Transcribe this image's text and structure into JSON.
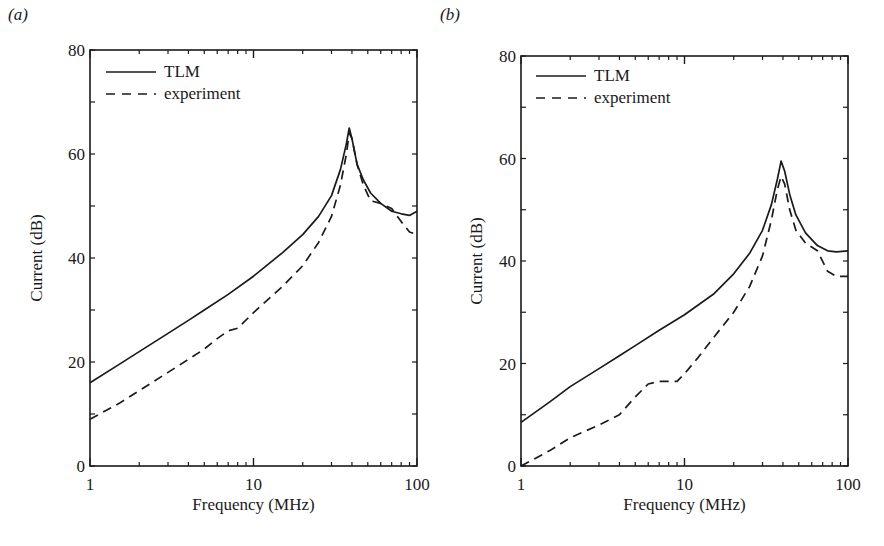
{
  "figure": {
    "panels": [
      "(a)",
      "(b)"
    ]
  },
  "chart_data": [
    {
      "type": "line",
      "panel_label": "(a)",
      "title": "",
      "xlabel": "Frequency (MHz)",
      "ylabel": "Current (dB)",
      "xscale": "log",
      "xlim": [
        1,
        100
      ],
      "ylim": [
        0,
        80
      ],
      "x_tick_labels": [
        "1",
        "10",
        "100"
      ],
      "y_tick_labels": [
        "0",
        "20",
        "40",
        "60",
        "80"
      ],
      "grid": false,
      "legend": {
        "position": "upper left",
        "entries": [
          "TLM",
          "experiment"
        ]
      },
      "series": [
        {
          "name": "TLM",
          "style": "solid",
          "x": [
            1,
            1.5,
            2,
            3,
            4,
            5,
            7,
            10,
            15,
            20,
            25,
            30,
            34,
            37,
            38.5,
            40,
            43,
            47,
            52,
            60,
            70,
            80,
            90,
            100
          ],
          "y": [
            16,
            19.5,
            22,
            25.5,
            28,
            30,
            33,
            36.5,
            41,
            44.5,
            48,
            52,
            57,
            62,
            65,
            63,
            58,
            55,
            52.5,
            50.5,
            49,
            48.5,
            48.2,
            49
          ]
        },
        {
          "name": "experiment",
          "style": "dashed",
          "x": [
            1,
            1.5,
            2,
            3,
            4,
            5,
            6,
            7,
            8,
            10,
            15,
            20,
            25,
            30,
            34,
            37,
            38.5,
            40,
            43,
            47,
            52,
            60,
            70,
            80,
            90,
            100
          ],
          "y": [
            9,
            12,
            14.5,
            18,
            20.5,
            22.5,
            24.5,
            26,
            26.5,
            29.5,
            34.5,
            38.5,
            43,
            48,
            54,
            60,
            64,
            63,
            58,
            54,
            51,
            50.5,
            49.5,
            47,
            45,
            44.5
          ]
        }
      ]
    },
    {
      "type": "line",
      "panel_label": "(b)",
      "title": "",
      "xlabel": "Frequency (MHz)",
      "ylabel": "Current (dB)",
      "xscale": "log",
      "xlim": [
        1,
        100
      ],
      "ylim": [
        0,
        80
      ],
      "x_tick_labels": [
        "1",
        "10",
        "100"
      ],
      "y_tick_labels": [
        "0",
        "20",
        "40",
        "60",
        "80"
      ],
      "grid": false,
      "legend": {
        "position": "upper left",
        "entries": [
          "TLM",
          "experiment"
        ]
      },
      "series": [
        {
          "name": "TLM",
          "style": "solid",
          "x": [
            1,
            1.5,
            2,
            3,
            4,
            5,
            7,
            10,
            15,
            20,
            25,
            30,
            34,
            37,
            39,
            41,
            44,
            48,
            55,
            65,
            75,
            85,
            100
          ],
          "y": [
            8.5,
            12.5,
            15.5,
            19,
            21.5,
            23.5,
            26.5,
            29.5,
            33.5,
            37.5,
            41.5,
            46,
            51,
            56,
            59.5,
            57.5,
            53,
            49,
            45.5,
            43,
            42,
            41.8,
            42
          ]
        },
        {
          "name": "experiment",
          "style": "dashed",
          "x": [
            1,
            1.5,
            2,
            3,
            4,
            5,
            6,
            7,
            8,
            9,
            10,
            12,
            15,
            20,
            25,
            30,
            34,
            37,
            39,
            41,
            44,
            48,
            55,
            65,
            75,
            85,
            100
          ],
          "y": [
            0,
            3,
            5.5,
            8,
            10,
            13.5,
            16,
            16.5,
            16.5,
            16.5,
            18,
            21,
            25,
            30,
            35,
            41,
            48,
            54,
            56.5,
            55,
            50,
            46,
            43.5,
            42,
            38,
            37,
            37
          ]
        }
      ]
    }
  ]
}
